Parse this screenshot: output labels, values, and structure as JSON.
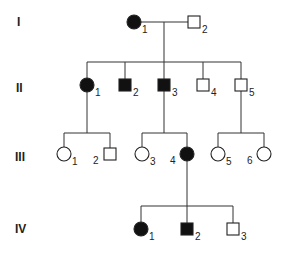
{
  "diagram": {
    "type": "pedigree",
    "generations": [
      {
        "label": "I",
        "y": 22
      },
      {
        "label": "II",
        "y": 86
      },
      {
        "label": "III",
        "y": 154
      },
      {
        "label": "IV",
        "y": 229
      }
    ],
    "individuals": [
      {
        "id": "I-1",
        "gen": "I",
        "num": "1",
        "sex": "female",
        "affected": true,
        "x": 134,
        "y": 22
      },
      {
        "id": "I-2",
        "gen": "I",
        "num": "2",
        "sex": "male",
        "affected": false,
        "x": 194,
        "y": 22
      },
      {
        "id": "II-1",
        "gen": "II",
        "num": "1",
        "sex": "female",
        "affected": true,
        "x": 87,
        "y": 85
      },
      {
        "id": "II-2",
        "gen": "II",
        "num": "2",
        "sex": "male",
        "affected": true,
        "x": 125,
        "y": 85
      },
      {
        "id": "II-3",
        "gen": "II",
        "num": "3",
        "sex": "male",
        "affected": true,
        "x": 164,
        "y": 85
      },
      {
        "id": "II-4",
        "gen": "II",
        "num": "4",
        "sex": "male",
        "affected": false,
        "x": 203,
        "y": 85
      },
      {
        "id": "II-5",
        "gen": "II",
        "num": "5",
        "sex": "male",
        "affected": false,
        "x": 241,
        "y": 85
      },
      {
        "id": "III-1",
        "gen": "III",
        "num": "1",
        "sex": "female",
        "affected": false,
        "x": 64,
        "y": 154
      },
      {
        "id": "III-2",
        "gen": "III",
        "num": "2",
        "sex": "male",
        "affected": false,
        "x": 110,
        "y": 154
      },
      {
        "id": "III-3",
        "gen": "III",
        "num": "3",
        "sex": "female",
        "affected": false,
        "x": 142,
        "y": 154
      },
      {
        "id": "III-4",
        "gen": "III",
        "num": "4",
        "sex": "female",
        "affected": true,
        "x": 187,
        "y": 154
      },
      {
        "id": "III-5",
        "gen": "III",
        "num": "5",
        "sex": "female",
        "affected": false,
        "x": 218,
        "y": 154
      },
      {
        "id": "III-6",
        "gen": "III",
        "num": "6",
        "sex": "female",
        "affected": false,
        "x": 264,
        "y": 154
      },
      {
        "id": "IV-1",
        "gen": "IV",
        "num": "1",
        "sex": "female",
        "affected": true,
        "x": 141,
        "y": 229
      },
      {
        "id": "IV-2",
        "gen": "IV",
        "num": "2",
        "sex": "male",
        "affected": true,
        "x": 187,
        "y": 229
      },
      {
        "id": "IV-3",
        "gen": "IV",
        "num": "3",
        "sex": "male",
        "affected": false,
        "x": 233,
        "y": 229
      }
    ],
    "colors": {
      "affected": "#111111",
      "unaffected": "#ffffff",
      "line": "#333333"
    }
  }
}
